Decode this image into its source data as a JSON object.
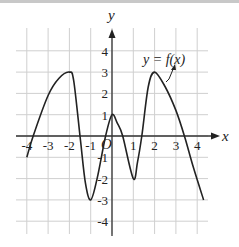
{
  "chart_data": {
    "type": "line",
    "title": "",
    "xlabel": "x",
    "ylabel": "y",
    "origin_label": "O",
    "function_label": "y = f(x)",
    "xlim": [
      -4.5,
      4.5
    ],
    "ylim": [
      -4.5,
      4.5
    ],
    "grid": true,
    "x_ticks": [
      "-4",
      "-3",
      "-2",
      "-1",
      "1",
      "2",
      "3",
      "4"
    ],
    "y_ticks": [
      "4",
      "3",
      "2",
      "1",
      "-1",
      "-2",
      "-3",
      "-4"
    ],
    "series": [
      {
        "name": "y = f(x)",
        "points": [
          [
            -4.0,
            -1.0
          ],
          [
            -3.7,
            0.0
          ],
          [
            -3.0,
            1.9
          ],
          [
            -2.5,
            2.7
          ],
          [
            -2.0,
            3.0
          ],
          [
            -1.8,
            2.6
          ],
          [
            -1.5,
            0.0
          ],
          [
            -1.25,
            -2.2
          ],
          [
            -1.0,
            -3.0
          ],
          [
            -0.7,
            -2.0
          ],
          [
            -0.3,
            0.0
          ],
          [
            0.0,
            1.0
          ],
          [
            0.25,
            0.6
          ],
          [
            0.5,
            0.0
          ],
          [
            1.0,
            -2.0
          ],
          [
            1.2,
            -1.2
          ],
          [
            1.4,
            0.0
          ],
          [
            1.7,
            2.3
          ],
          [
            2.0,
            3.0
          ],
          [
            2.5,
            2.3
          ],
          [
            3.0,
            1.2
          ],
          [
            3.4,
            0.0
          ],
          [
            3.8,
            -1.4
          ],
          [
            4.3,
            -3.0
          ]
        ],
        "local_maxima": [
          [
            -2,
            3
          ],
          [
            0,
            1
          ],
          [
            2,
            3
          ]
        ],
        "local_minima": [
          [
            -1,
            -3
          ],
          [
            1,
            -2
          ]
        ],
        "color": "#222222"
      }
    ]
  }
}
